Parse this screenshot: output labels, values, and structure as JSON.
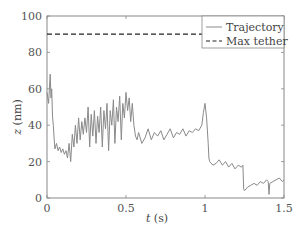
{
  "chart_data": {
    "type": "line",
    "title": "",
    "xlabel": "t (s)",
    "ylabel": "z (nm)",
    "xlim": [
      0,
      1.5
    ],
    "ylim": [
      0,
      100
    ],
    "xticks": [
      0,
      0.5,
      1,
      1.5
    ],
    "xtick_labels": [
      "0",
      "0.5",
      "1",
      "1.5"
    ],
    "yticks": [
      0,
      20,
      40,
      60,
      80,
      100
    ],
    "ytick_labels": [
      "0",
      "20",
      "40",
      "60",
      "80",
      "100"
    ],
    "grid": false,
    "legend_position": "upper right",
    "legend": [
      "Trajectory",
      "Max tether"
    ],
    "series": [
      {
        "name": "Trajectory",
        "style": "solid",
        "color": "#8a8a8a",
        "x": [
          0.0,
          0.01,
          0.02,
          0.025,
          0.03,
          0.035,
          0.04,
          0.045,
          0.05,
          0.06,
          0.07,
          0.08,
          0.09,
          0.1,
          0.11,
          0.12,
          0.13,
          0.14,
          0.15,
          0.16,
          0.17,
          0.18,
          0.19,
          0.2,
          0.21,
          0.22,
          0.23,
          0.24,
          0.25,
          0.26,
          0.27,
          0.28,
          0.29,
          0.3,
          0.31,
          0.32,
          0.33,
          0.34,
          0.35,
          0.36,
          0.37,
          0.38,
          0.39,
          0.4,
          0.41,
          0.42,
          0.43,
          0.44,
          0.45,
          0.46,
          0.47,
          0.48,
          0.49,
          0.5,
          0.51,
          0.52,
          0.53,
          0.54,
          0.55,
          0.56,
          0.57,
          0.58,
          0.6,
          0.62,
          0.64,
          0.66,
          0.68,
          0.7,
          0.72,
          0.74,
          0.76,
          0.78,
          0.8,
          0.82,
          0.84,
          0.86,
          0.88,
          0.9,
          0.92,
          0.94,
          0.96,
          0.98,
          0.99,
          1.0,
          1.01,
          1.02,
          1.025,
          1.03,
          1.05,
          1.07,
          1.09,
          1.11,
          1.13,
          1.15,
          1.17,
          1.19,
          1.21,
          1.23,
          1.24,
          1.245,
          1.25,
          1.27,
          1.29,
          1.31,
          1.33,
          1.35,
          1.37,
          1.39,
          1.4,
          1.405,
          1.41,
          1.43,
          1.45,
          1.47,
          1.49,
          1.5
        ],
        "y": [
          58,
          52,
          68,
          55,
          60,
          45,
          40,
          33,
          27,
          30,
          26,
          28,
          25,
          27,
          24,
          26,
          22,
          30,
          20,
          35,
          28,
          40,
          30,
          44,
          32,
          42,
          35,
          44,
          36,
          50,
          28,
          46,
          34,
          48,
          30,
          45,
          36,
          50,
          28,
          48,
          38,
          52,
          26,
          48,
          40,
          54,
          30,
          50,
          42,
          56,
          32,
          52,
          44,
          58,
          48,
          55,
          42,
          52,
          40,
          34,
          32,
          36,
          30,
          33,
          38,
          32,
          36,
          34,
          37,
          32,
          35,
          38,
          33,
          36,
          35,
          38,
          34,
          37,
          36,
          38,
          37,
          40,
          47,
          52,
          44,
          30,
          22,
          20,
          18,
          19,
          21,
          18,
          20,
          17,
          19,
          16,
          18,
          17,
          18,
          5,
          4,
          6,
          7,
          8,
          7,
          9,
          8,
          10,
          9,
          2,
          8,
          9,
          10,
          11,
          9,
          10
        ]
      },
      {
        "name": "Max tether",
        "style": "dashed",
        "color": "#222222",
        "x": [
          0,
          1.5
        ],
        "y": [
          90,
          90
        ]
      }
    ]
  }
}
